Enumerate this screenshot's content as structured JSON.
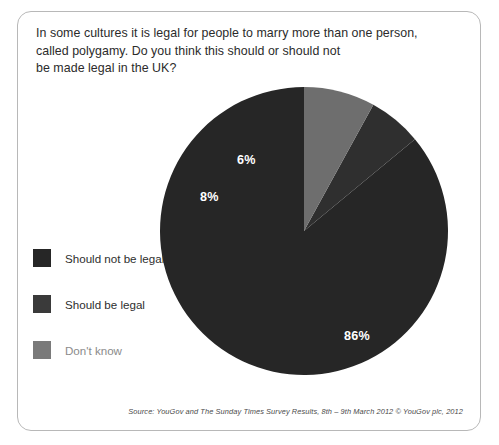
{
  "question": {
    "lines": [
      "In some cultures it is legal for people to marry more than one person,",
      "called polygamy. Do you think this should or should not",
      "be made legal in the UK?"
    ]
  },
  "legend": {
    "items": [
      {
        "label": "Should not be legal",
        "color": "#262626"
      },
      {
        "label": "Should be legal",
        "color": "#3a3a3a"
      },
      {
        "label": "Don't know",
        "color": "#7a7a7a"
      }
    ]
  },
  "source": {
    "text": "Source: YouGov and The Sunday Times Survey Results, 8th – 9th March 2012 © YouGov plc, 2012"
  },
  "chart_data": {
    "type": "pie",
    "title": "In some cultures it is legal for people to marry more than one person, called polygamy. Do you think this should or should not be made legal in the UK?",
    "unit": "%",
    "start_angle_deg": 0,
    "direction": "counterclockwise",
    "legend_position": "left",
    "grid": false,
    "categories": [
      "Should not be legal",
      "Should be legal",
      "Don't know"
    ],
    "values": [
      86,
      6,
      8
    ],
    "labels": [
      "86%",
      "6%",
      "8%"
    ],
    "colors": [
      "#262626",
      "#2f2f2f",
      "#6e6e6e"
    ],
    "total": 100
  }
}
